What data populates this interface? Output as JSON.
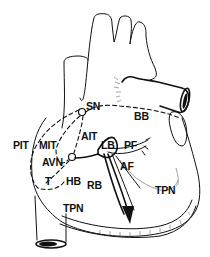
{
  "diagram": {
    "type": "anatomical-line-drawing",
    "labels": {
      "sn": "SN",
      "bb": "BB",
      "pit": "PIT",
      "mit": "MIT",
      "ait": "AIT",
      "lb": "LB",
      "pf": "PF",
      "avn": "AVN",
      "af": "AF",
      "t": "T",
      "hb": "HB",
      "rb": "RB",
      "tpn_left": "TPN",
      "tpn_right": "TPN"
    },
    "colors": {
      "ink": "#111111",
      "background": "#ffffff"
    }
  }
}
